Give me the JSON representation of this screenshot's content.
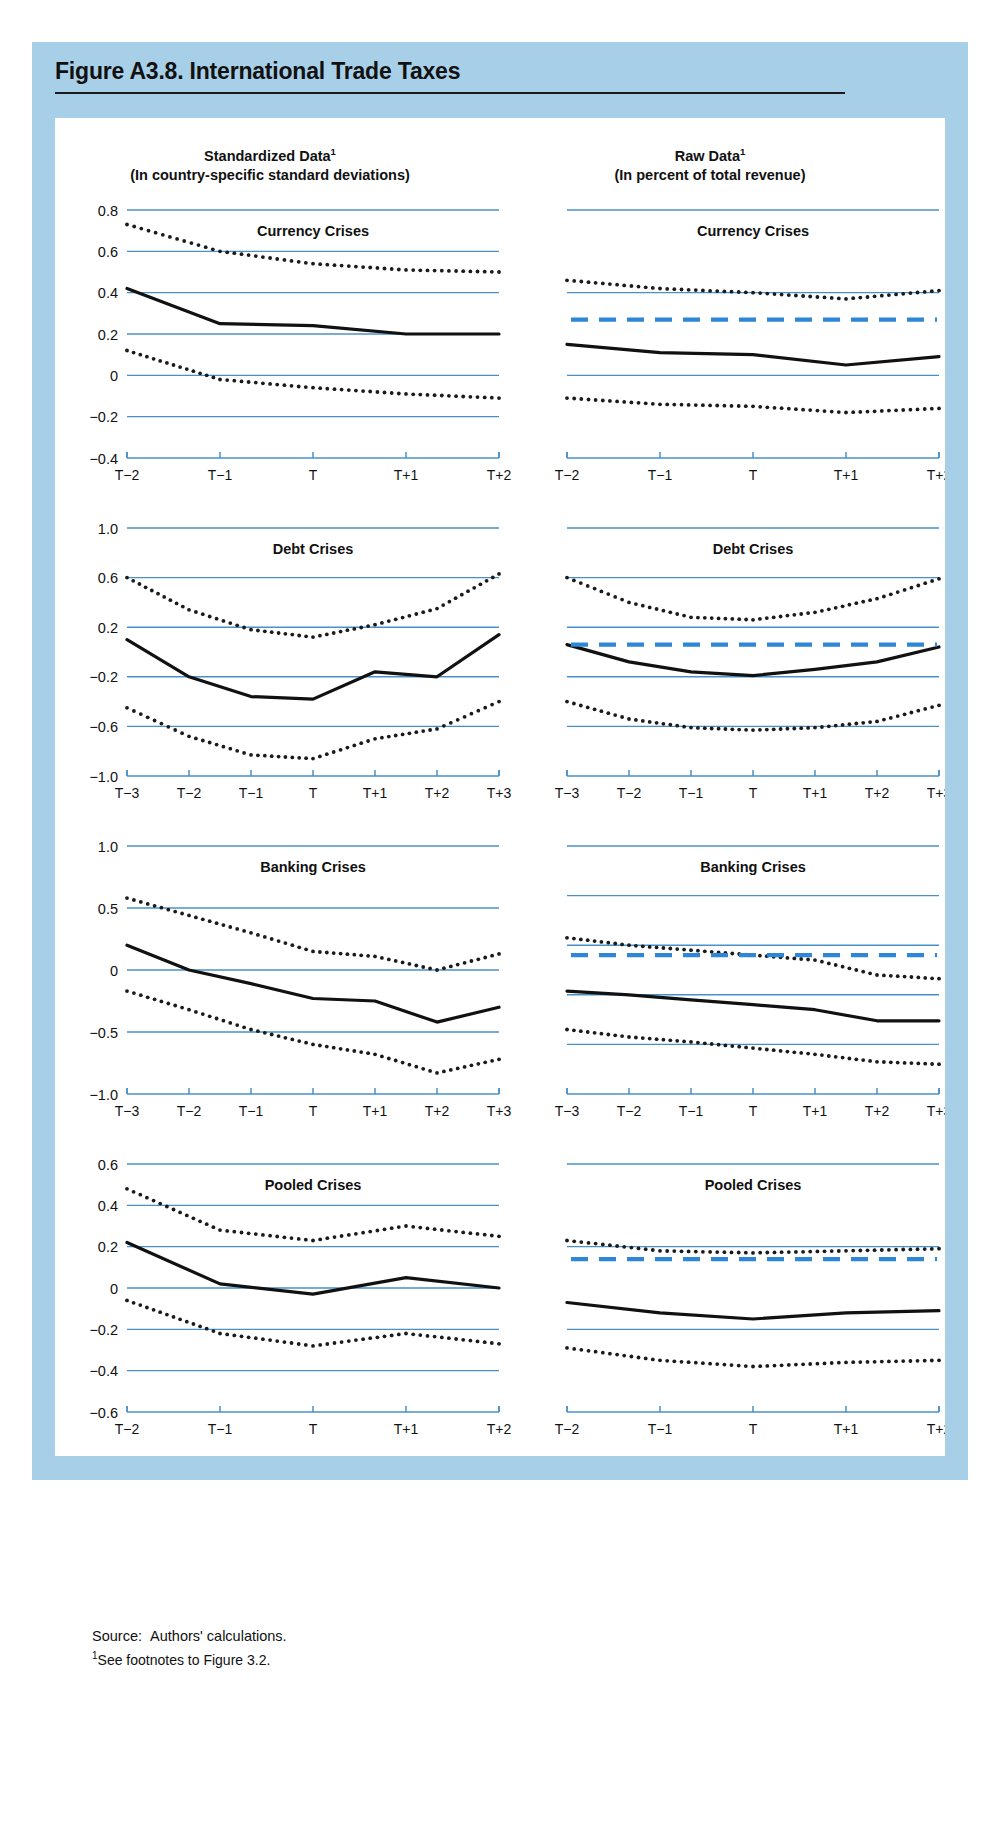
{
  "figure": {
    "title": "Figure A3.8. International Trade Taxes",
    "source_label": "Source:",
    "source_text": "Authors' calculations.",
    "footnote_mark": "1",
    "footnote_text": "See footnotes to Figure 3.2."
  },
  "columns": {
    "left": {
      "title": "Standardized Data",
      "mark": "1",
      "subtitle": "(In country-specific standard deviations)"
    },
    "right": {
      "title": "Raw Data",
      "mark": "1",
      "subtitle": "(In percent of total revenue)"
    }
  },
  "colors": {
    "gridline": "#4a90c8",
    "axis": "#4a90c8",
    "series_line": "#111111",
    "band_dots": "#1a1a1a",
    "reference_dashed": "#2f86d6",
    "page_frame": "#a8cfe8",
    "card": "#ffffff",
    "title_rule": "#1a1a1a"
  },
  "legend_note": {
    "solid": "median",
    "dotted": "interquartile band",
    "dashed_blue": "all-country average"
  },
  "chart_data": [
    {
      "id": "std-currency",
      "type": "line",
      "column": "Standardized Data",
      "title": "Currency Crises",
      "xlabel": "",
      "ylabel": "",
      "categories": [
        "T−2",
        "T−1",
        "T",
        "T+1",
        "T+2"
      ],
      "yticks": [
        0.8,
        0.6,
        0.4,
        0.2,
        0,
        -0.2,
        -0.4
      ],
      "ytick_labels": [
        "0.8",
        "0.6",
        "0.4",
        "0.2",
        "0",
        "−0.2",
        "−0.4"
      ],
      "ylim": [
        -0.4,
        0.8
      ],
      "grid": true,
      "series": [
        {
          "name": "median",
          "style": "solid",
          "values": [
            0.42,
            0.25,
            0.24,
            0.2,
            0.2
          ]
        },
        {
          "name": "upper band",
          "style": "dotted",
          "values": [
            0.73,
            0.6,
            0.54,
            0.51,
            0.5
          ]
        },
        {
          "name": "lower band",
          "style": "dotted",
          "values": [
            0.12,
            -0.02,
            -0.06,
            -0.09,
            -0.11
          ]
        }
      ]
    },
    {
      "id": "raw-currency",
      "type": "line",
      "column": "Raw Data",
      "title": "Currency Crises",
      "xlabel": "",
      "ylabel": "",
      "categories": [
        "T−2",
        "T−1",
        "T",
        "T+1",
        "T+2"
      ],
      "yticks": [
        20,
        16,
        12,
        8
      ],
      "ytick_labels": [
        "20",
        "16",
        "12",
        "8"
      ],
      "ylim": [
        8,
        20
      ],
      "grid": true,
      "series": [
        {
          "name": "median",
          "style": "solid",
          "values": [
            13.5,
            13.1,
            13.0,
            12.5,
            12.9
          ]
        },
        {
          "name": "upper band",
          "style": "dotted",
          "values": [
            16.6,
            16.2,
            16.0,
            15.7,
            16.1
          ]
        },
        {
          "name": "lower band",
          "style": "dotted",
          "values": [
            10.9,
            10.6,
            10.5,
            10.2,
            10.4
          ]
        },
        {
          "name": "average",
          "style": "dashed-blue",
          "values": [
            14.7,
            14.7,
            14.7,
            14.7,
            14.7
          ]
        }
      ]
    },
    {
      "id": "std-debt",
      "type": "line",
      "column": "Standardized Data",
      "title": "Debt Crises",
      "xlabel": "",
      "ylabel": "",
      "categories": [
        "T−3",
        "T−2",
        "T−1",
        "T",
        "T+1",
        "T+2",
        "T+3"
      ],
      "yticks": [
        1.0,
        0.6,
        0.2,
        -0.2,
        -0.6,
        -1.0
      ],
      "ytick_labels": [
        "1.0",
        "0.6",
        "0.2",
        "−0.2",
        "−0.6",
        "−1.0"
      ],
      "ylim": [
        -1.0,
        1.0
      ],
      "grid": true,
      "series": [
        {
          "name": "median",
          "style": "solid",
          "values": [
            0.1,
            -0.2,
            -0.36,
            -0.38,
            -0.16,
            -0.2,
            0.14
          ]
        },
        {
          "name": "upper band",
          "style": "dotted",
          "values": [
            0.6,
            0.34,
            0.18,
            0.12,
            0.22,
            0.35,
            0.63
          ]
        },
        {
          "name": "lower band",
          "style": "dotted",
          "values": [
            -0.45,
            -0.68,
            -0.83,
            -0.86,
            -0.7,
            -0.62,
            -0.4
          ]
        }
      ]
    },
    {
      "id": "raw-debt",
      "type": "line",
      "column": "Raw Data",
      "title": "Debt Crises",
      "xlabel": "",
      "ylabel": "",
      "categories": [
        "T−3",
        "T−2",
        "T−1",
        "T",
        "T+1",
        "T+2",
        "T+3"
      ],
      "yticks": [
        24,
        20,
        16,
        12,
        8,
        4
      ],
      "ytick_labels": [
        "24",
        "20",
        "16",
        "12",
        "8",
        "4"
      ],
      "ylim": [
        4,
        24
      ],
      "grid": true,
      "series": [
        {
          "name": "median",
          "style": "solid",
          "values": [
            14.6,
            13.2,
            12.4,
            12.1,
            12.6,
            13.2,
            14.4
          ]
        },
        {
          "name": "upper band",
          "style": "dotted",
          "values": [
            20.0,
            18.0,
            16.8,
            16.6,
            17.2,
            18.3,
            19.9
          ]
        },
        {
          "name": "lower band",
          "style": "dotted",
          "values": [
            10.0,
            8.6,
            7.9,
            7.7,
            7.9,
            8.4,
            9.7
          ]
        },
        {
          "name": "average",
          "style": "dashed-blue",
          "values": [
            14.6,
            14.6,
            14.6,
            14.6,
            14.6,
            14.6,
            14.6
          ]
        }
      ]
    },
    {
      "id": "std-banking",
      "type": "line",
      "column": "Standardized Data",
      "title": "Banking Crises",
      "xlabel": "",
      "ylabel": "",
      "categories": [
        "T−3",
        "T−2",
        "T−1",
        "T",
        "T+1",
        "T+2",
        "T+3"
      ],
      "yticks": [
        1.0,
        0.5,
        0,
        -0.5,
        -1.0
      ],
      "ytick_labels": [
        "1.0",
        "0.5",
        "0",
        "−0.5",
        "−1.0"
      ],
      "ylim": [
        -1.0,
        1.0
      ],
      "grid": true,
      "series": [
        {
          "name": "median",
          "style": "solid",
          "values": [
            0.2,
            0.0,
            -0.11,
            -0.23,
            -0.25,
            -0.42,
            -0.3
          ]
        },
        {
          "name": "upper band",
          "style": "dotted",
          "values": [
            0.58,
            0.44,
            0.3,
            0.15,
            0.11,
            0.0,
            0.13
          ]
        },
        {
          "name": "lower band",
          "style": "dotted",
          "values": [
            -0.17,
            -0.32,
            -0.48,
            -0.6,
            -0.68,
            -0.83,
            -0.72
          ]
        }
      ]
    },
    {
      "id": "raw-banking",
      "type": "line",
      "column": "Raw Data",
      "title": "Banking Crises",
      "xlabel": "",
      "ylabel": "",
      "categories": [
        "T−3",
        "T−2",
        "T−1",
        "T",
        "T+1",
        "T+2",
        "T+3"
      ],
      "yticks": [
        24,
        20,
        16,
        12,
        8,
        4
      ],
      "ytick_labels": [
        "24",
        "20",
        "16",
        "12",
        "8",
        "4"
      ],
      "ylim": [
        4,
        24
      ],
      "grid": true,
      "series": [
        {
          "name": "median",
          "style": "solid",
          "values": [
            12.3,
            12.0,
            11.6,
            11.2,
            10.8,
            9.9,
            9.9
          ]
        },
        {
          "name": "upper band",
          "style": "dotted",
          "values": [
            16.6,
            16.0,
            15.6,
            15.2,
            14.8,
            13.6,
            13.3
          ]
        },
        {
          "name": "lower band",
          "style": "dotted",
          "values": [
            9.2,
            8.6,
            8.2,
            7.7,
            7.2,
            6.6,
            6.4
          ]
        },
        {
          "name": "average",
          "style": "dashed-blue",
          "values": [
            15.2,
            15.2,
            15.2,
            15.2,
            15.2,
            15.2,
            15.2
          ]
        }
      ]
    },
    {
      "id": "std-pooled",
      "type": "line",
      "column": "Standardized Data",
      "title": "Pooled Crises",
      "xlabel": "",
      "ylabel": "",
      "categories": [
        "T−2",
        "T−1",
        "T",
        "T+1",
        "T+2"
      ],
      "yticks": [
        0.6,
        0.4,
        0.2,
        0,
        -0.2,
        -0.4,
        -0.6
      ],
      "ytick_labels": [
        "0.6",
        "0.4",
        "0.2",
        "0",
        "−0.2",
        "−0.4",
        "−0.6"
      ],
      "ylim": [
        -0.6,
        0.6
      ],
      "grid": true,
      "series": [
        {
          "name": "median",
          "style": "solid",
          "values": [
            0.22,
            0.02,
            -0.03,
            0.05,
            0.0
          ]
        },
        {
          "name": "upper band",
          "style": "dotted",
          "values": [
            0.48,
            0.28,
            0.23,
            0.3,
            0.25
          ]
        },
        {
          "name": "lower band",
          "style": "dotted",
          "values": [
            -0.06,
            -0.22,
            -0.28,
            -0.22,
            -0.27
          ]
        }
      ]
    },
    {
      "id": "raw-pooled",
      "type": "line",
      "column": "Raw Data",
      "title": "Pooled Crises",
      "xlabel": "",
      "ylabel": "",
      "categories": [
        "T−2",
        "T−1",
        "T",
        "T+1",
        "T+2"
      ],
      "yticks": [
        20,
        16,
        12,
        8
      ],
      "ytick_labels": [
        "20",
        "16",
        "12",
        "8"
      ],
      "ylim": [
        8,
        20
      ],
      "grid": true,
      "series": [
        {
          "name": "median",
          "style": "solid",
          "values": [
            13.3,
            12.8,
            12.5,
            12.8,
            12.9
          ]
        },
        {
          "name": "upper band",
          "style": "dotted",
          "values": [
            16.3,
            15.8,
            15.7,
            15.8,
            15.9
          ]
        },
        {
          "name": "lower band",
          "style": "dotted",
          "values": [
            11.1,
            10.5,
            10.2,
            10.4,
            10.5
          ]
        },
        {
          "name": "average",
          "style": "dashed-blue",
          "values": [
            15.4,
            15.4,
            15.4,
            15.4,
            15.4,
            15.4
          ]
        }
      ]
    }
  ]
}
